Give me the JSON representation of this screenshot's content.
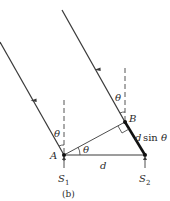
{
  "figure": {
    "caption": "(b)",
    "colors": {
      "line": "#3a3a3a",
      "thick_segment": "#111111",
      "dashed": "#555555",
      "text": "#2a2a2a"
    },
    "labels": {
      "theta_top_B": "θ",
      "theta_top_A": "θ",
      "theta_angle_A": "θ",
      "point_A": "A",
      "point_B": "B",
      "distance_d": "d",
      "path_difference_d": "d",
      "path_difference_sin": "sin",
      "path_difference_theta": "θ",
      "source_1_S": "S",
      "source_1_sub": "1",
      "source_2_S": "S",
      "source_2_sub": "2"
    },
    "elements": {
      "rays": [
        "ray-from-S1",
        "ray-from-S2"
      ],
      "dashed_normals": [
        "normal-at-A",
        "normal-at-B"
      ],
      "segments": [
        "baseline-d",
        "perpendicular-A-to-B",
        "path-difference-segment"
      ],
      "markers": [
        "right-angle-marker",
        "angle-arc-A"
      ]
    }
  }
}
